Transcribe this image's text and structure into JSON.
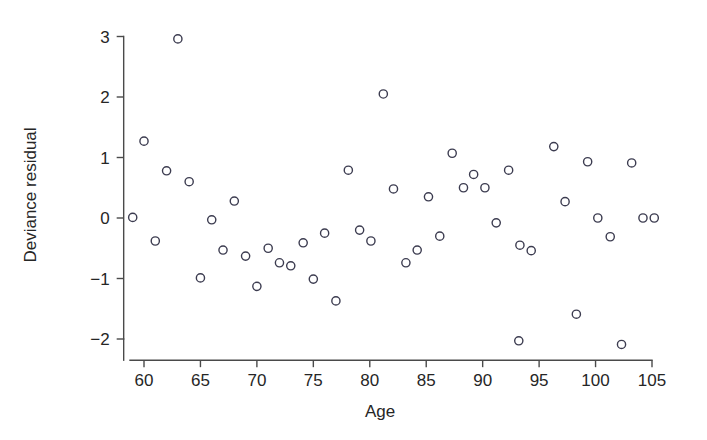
{
  "chart_data": {
    "type": "scatter",
    "title": "",
    "xlabel": "Age",
    "ylabel": "Deviance residual",
    "xlim": [
      58.2,
      105.8
    ],
    "ylim": [
      -2.35,
      3.15
    ],
    "xticks": [
      60,
      65,
      70,
      75,
      80,
      85,
      90,
      95,
      100,
      105
    ],
    "xtick_labels": [
      "60",
      "65",
      "70",
      "75",
      "80",
      "85",
      "90",
      "95",
      "100",
      "105"
    ],
    "yticks": [
      -2,
      -1,
      0,
      1,
      2,
      3
    ],
    "ytick_labels": [
      "-2",
      "-1",
      "0",
      "1",
      "2",
      "3"
    ],
    "grid": false,
    "legend": "none",
    "marker": "open-circle",
    "marker_color": "#3c3c50",
    "x": [
      59.0,
      60.0,
      61.0,
      62.0,
      63.0,
      64.0,
      65.0,
      66.0,
      67.0,
      68.0,
      69.0,
      70.0,
      71.0,
      72.0,
      73.0,
      74.1,
      75.0,
      76.0,
      77.0,
      78.1,
      79.1,
      80.1,
      81.2,
      82.1,
      83.2,
      84.2,
      85.2,
      86.2,
      87.3,
      88.3,
      89.2,
      90.2,
      91.2,
      92.3,
      93.2,
      93.3,
      94.3,
      96.3,
      97.3,
      98.3,
      99.3,
      100.2,
      101.3,
      102.3,
      103.2,
      104.2,
      105.2
    ],
    "y": [
      0.01,
      1.27,
      -0.38,
      0.78,
      2.96,
      0.6,
      -0.99,
      -0.03,
      -0.53,
      0.28,
      -0.63,
      -1.13,
      -0.5,
      -0.74,
      -0.79,
      -0.41,
      -1.01,
      -0.25,
      -1.37,
      0.79,
      -0.2,
      -0.38,
      2.05,
      0.48,
      -0.74,
      -0.53,
      0.35,
      -0.3,
      1.07,
      0.5,
      0.72,
      0.5,
      -0.08,
      0.79,
      -2.03,
      -0.45,
      -0.54,
      1.18,
      0.27,
      -1.59,
      0.93,
      0.0,
      -0.31,
      -2.09,
      0.91,
      0.0,
      0.0
    ],
    "points": [
      {
        "x": 59.0,
        "y": 0.01
      },
      {
        "x": 60.0,
        "y": 1.27
      },
      {
        "x": 61.0,
        "y": -0.38
      },
      {
        "x": 62.0,
        "y": 0.78
      },
      {
        "x": 63.0,
        "y": 2.96
      },
      {
        "x": 64.0,
        "y": 0.6
      },
      {
        "x": 65.0,
        "y": -0.99
      },
      {
        "x": 66.0,
        "y": -0.03
      },
      {
        "x": 67.0,
        "y": -0.53
      },
      {
        "x": 68.0,
        "y": 0.28
      },
      {
        "x": 69.0,
        "y": -0.63
      },
      {
        "x": 70.0,
        "y": -1.13
      },
      {
        "x": 71.0,
        "y": -0.5
      },
      {
        "x": 72.0,
        "y": -0.74
      },
      {
        "x": 73.0,
        "y": -0.79
      },
      {
        "x": 74.1,
        "y": -0.41
      },
      {
        "x": 75.0,
        "y": -1.01
      },
      {
        "x": 76.0,
        "y": -0.25
      },
      {
        "x": 77.0,
        "y": -1.37
      },
      {
        "x": 78.1,
        "y": 0.79
      },
      {
        "x": 79.1,
        "y": -0.2
      },
      {
        "x": 80.1,
        "y": -0.38
      },
      {
        "x": 81.2,
        "y": 2.05
      },
      {
        "x": 82.1,
        "y": 0.48
      },
      {
        "x": 83.2,
        "y": -0.74
      },
      {
        "x": 84.2,
        "y": -0.53
      },
      {
        "x": 85.2,
        "y": 0.35
      },
      {
        "x": 86.2,
        "y": -0.3
      },
      {
        "x": 87.3,
        "y": 1.07
      },
      {
        "x": 88.3,
        "y": 0.5
      },
      {
        "x": 89.2,
        "y": 0.72
      },
      {
        "x": 90.2,
        "y": 0.5
      },
      {
        "x": 91.2,
        "y": -0.08
      },
      {
        "x": 92.3,
        "y": 0.79
      },
      {
        "x": 93.2,
        "y": -2.03
      },
      {
        "x": 93.3,
        "y": -0.45
      },
      {
        "x": 94.3,
        "y": -0.54
      },
      {
        "x": 96.3,
        "y": 1.18
      },
      {
        "x": 97.3,
        "y": 0.27
      },
      {
        "x": 98.3,
        "y": -1.59
      },
      {
        "x": 99.3,
        "y": 0.93
      },
      {
        "x": 100.2,
        "y": 0.0
      },
      {
        "x": 101.3,
        "y": -0.31
      },
      {
        "x": 102.3,
        "y": -2.09
      },
      {
        "x": 103.2,
        "y": 0.91
      },
      {
        "x": 104.2,
        "y": 0.0
      },
      {
        "x": 105.2,
        "y": 0.0
      }
    ]
  }
}
